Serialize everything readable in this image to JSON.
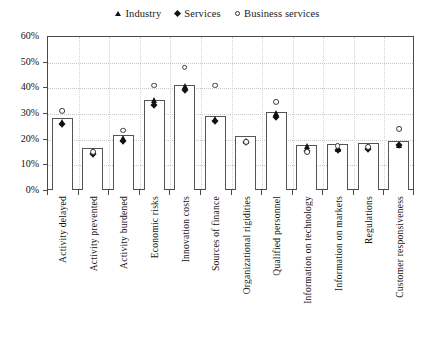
{
  "chart_data": {
    "type": "bar",
    "title": "",
    "subtitle": "",
    "xlabel": "",
    "ylabel": "",
    "ylim": [
      0,
      60
    ],
    "ytick_labels": [
      "0%",
      "10%",
      "20%",
      "30%",
      "40%",
      "50%",
      "60%"
    ],
    "ytick_values": [
      0,
      10,
      20,
      30,
      40,
      50,
      60
    ],
    "grid": "horizontal-and-vertical-dotted",
    "legend_position": "top-center",
    "bar_series_name": "Total",
    "categories": [
      "Activity delayed",
      "Activity prevented",
      "Activity burdened",
      "Economic risks",
      "Innovation costs",
      "Sources of finance",
      "Organizational rigidities",
      "Qualified personnel",
      "Information on technology",
      "Information on markets",
      "Regulations",
      "Customer responsiveness"
    ],
    "values": [
      28.0,
      16.5,
      21.5,
      35.0,
      41.0,
      29.0,
      21.0,
      30.5,
      17.5,
      18.0,
      18.5,
      19.0
    ],
    "series": [
      {
        "name": "Industry",
        "marker": "triangle",
        "values": [
          29.0,
          17.5,
          22.5,
          37.5,
          43.0,
          30.0,
          21.5,
          32.5,
          19.5,
          18.5,
          19.0,
          20.0
        ]
      },
      {
        "name": "Services",
        "marker": "diamond",
        "values": [
          27.5,
          16.0,
          21.0,
          35.0,
          41.0,
          29.0,
          20.5,
          30.5,
          17.0,
          17.5,
          18.0,
          19.5
        ]
      },
      {
        "name": "Business services",
        "marker": "circle",
        "values": [
          33.0,
          17.0,
          25.5,
          43.0,
          50.0,
          43.0,
          21.0,
          36.5,
          17.0,
          19.5,
          19.0,
          26.0
        ]
      }
    ]
  },
  "legend": {
    "items": [
      {
        "label": "Industry",
        "symbol": "triangle-marker"
      },
      {
        "label": "Services",
        "symbol": "diamond-marker"
      },
      {
        "label": "Business services",
        "symbol": "circle-marker"
      }
    ]
  },
  "colors": {
    "axis": "#4a4a4a",
    "grid": "#c8c8c8",
    "marker": "#111111",
    "bar_fill": "#ffffff",
    "bar_stroke": "#555555",
    "text": "#111111"
  }
}
